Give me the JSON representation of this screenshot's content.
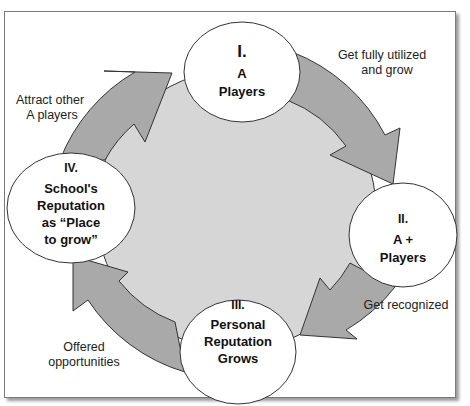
{
  "diagram": {
    "type": "cycle",
    "colors": {
      "arrow_fill": "#a9a9a9",
      "inner_fill": "#d6d6d6",
      "node_fill": "#ffffff",
      "stroke": "#333333",
      "frame": "#7a7a7a"
    },
    "nodes": [
      {
        "numeral": "I.",
        "lines": [
          "A",
          "Players"
        ]
      },
      {
        "numeral": "II.",
        "lines": [
          "A +",
          "Players"
        ]
      },
      {
        "numeral": "III.",
        "lines": [
          "Personal",
          "Reputation",
          "Grows"
        ]
      },
      {
        "numeral": "IV.",
        "lines": [
          "School's",
          "Reputation",
          "as “Place",
          "to grow”"
        ]
      }
    ],
    "edges": [
      {
        "from": "I",
        "to": "II",
        "label_lines": [
          "Get fully utilized",
          "and grow"
        ]
      },
      {
        "from": "II",
        "to": "III",
        "label_lines": [
          "Get recognized"
        ]
      },
      {
        "from": "III",
        "to": "IV",
        "label_lines": [
          "Offered",
          "opportunities"
        ]
      },
      {
        "from": "IV",
        "to": "I",
        "label_lines": [
          "Attract other",
          "A players"
        ]
      }
    ]
  }
}
